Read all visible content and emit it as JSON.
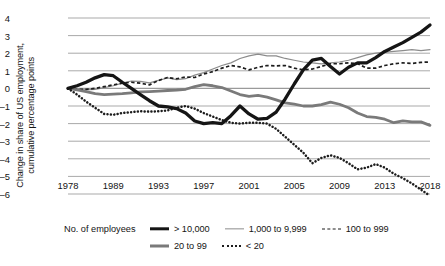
{
  "chart_data": {
    "type": "line",
    "title": "",
    "subtitle": "",
    "xlabel": "",
    "ylabel": "Change in share of US employment,\ncumulative percentage points",
    "ylabel_line1": "Change in share of US employment,",
    "ylabel_line2": "cumulative percentage points",
    "ylim": [
      -6,
      4
    ],
    "yticks": [
      4,
      3,
      2,
      1,
      0,
      -1,
      -2,
      -3,
      -4,
      -5,
      -6
    ],
    "ytick_labels": [
      "4",
      "3",
      "2",
      "1",
      "0",
      "–1",
      "–2",
      "–3",
      "–4",
      "–5",
      "–6"
    ],
    "xlim": [
      1978,
      2018
    ],
    "xticks": [
      1978,
      1989,
      1993,
      1997,
      2001,
      2005,
      2009,
      2013,
      2018
    ],
    "xtick_labels": [
      "1978",
      "1989",
      "1993",
      "1997",
      "2001",
      "2005",
      "2009",
      "2013",
      "2018"
    ],
    "grid": true,
    "grid_axis": "y",
    "legend_position": "bottom",
    "legend_title": "No. of employees",
    "colors": {
      "gt10000": "#151515",
      "k1000to9999": "#8c8c8c",
      "k100to999": "#1d1d1d",
      "k20to99": "#7a7a7a",
      "lt20": "#1d1d1d",
      "gridline": "#9a9a9a",
      "axis": "#4a4a4a",
      "text": "#141414",
      "background": "#ffffff"
    },
    "x": [
      1978,
      1979,
      1980,
      1981,
      1982,
      1983,
      1984,
      1985,
      1986,
      1987,
      1988,
      1989,
      1990,
      1991,
      1992,
      1993,
      1994,
      1995,
      1996,
      1997,
      1998,
      1999,
      2000,
      2001,
      2002,
      2003,
      2004,
      2005,
      2006,
      2007,
      2008,
      2009,
      2010,
      2011,
      2012,
      2013,
      2014,
      2015,
      2016,
      2017,
      2018
    ],
    "series": [
      {
        "name": "> 10,000",
        "style": "solid-thick",
        "color": "#151515",
        "values": [
          0.0,
          0.15,
          0.35,
          0.6,
          0.78,
          0.72,
          0.35,
          0.0,
          -0.35,
          -0.7,
          -1.0,
          -1.05,
          -1.15,
          -1.4,
          -1.85,
          -2.0,
          -1.95,
          -2.0,
          -1.55,
          -1.0,
          -1.45,
          -1.75,
          -1.7,
          -1.35,
          -0.6,
          0.25,
          1.05,
          1.6,
          1.7,
          1.25,
          0.82,
          1.2,
          1.45,
          1.45,
          1.75,
          2.1,
          2.35,
          2.6,
          2.9,
          3.2,
          3.6
        ]
      },
      {
        "name": "1,000 to 9,999",
        "style": "solid-thin",
        "color": "#8c8c8c",
        "values": [
          0.0,
          -0.05,
          -0.08,
          -0.05,
          0.05,
          0.15,
          0.3,
          0.42,
          0.4,
          0.32,
          0.45,
          0.6,
          0.5,
          0.55,
          0.75,
          0.9,
          1.1,
          1.3,
          1.45,
          1.7,
          1.85,
          1.95,
          1.85,
          1.85,
          1.7,
          1.6,
          1.5,
          1.45,
          1.4,
          1.45,
          1.5,
          1.6,
          1.75,
          1.9,
          2.0,
          2.05,
          2.1,
          2.15,
          2.2,
          2.15,
          2.2
        ]
      },
      {
        "name": "100 to 999",
        "style": "dashed",
        "color": "#1d1d1d",
        "values": [
          0.0,
          -0.05,
          -0.05,
          0.0,
          0.1,
          0.2,
          0.3,
          0.35,
          0.3,
          0.2,
          0.45,
          0.62,
          0.55,
          0.65,
          0.62,
          0.82,
          0.95,
          1.15,
          1.3,
          1.22,
          1.05,
          1.2,
          1.3,
          1.28,
          1.3,
          1.15,
          1.05,
          1.1,
          1.25,
          1.4,
          1.4,
          1.45,
          1.4,
          1.15,
          1.15,
          1.3,
          1.4,
          1.45,
          1.42,
          1.48,
          1.5
        ]
      },
      {
        "name": "20 to 99",
        "style": "solid-medium",
        "color": "#7a7a7a",
        "values": [
          0.0,
          -0.08,
          -0.18,
          -0.3,
          -0.35,
          -0.32,
          -0.3,
          -0.25,
          -0.2,
          -0.18,
          -0.15,
          -0.12,
          -0.1,
          -0.05,
          0.1,
          0.22,
          0.15,
          0.05,
          -0.15,
          -0.35,
          -0.45,
          -0.4,
          -0.5,
          -0.65,
          -0.82,
          -0.9,
          -1.0,
          -1.0,
          -0.92,
          -0.78,
          -0.9,
          -1.1,
          -1.4,
          -1.6,
          -1.65,
          -1.75,
          -1.95,
          -1.85,
          -1.9,
          -1.9,
          -2.1
        ]
      },
      {
        "name": "< 20",
        "style": "dotted",
        "color": "#1d1d1d",
        "values": [
          0.0,
          -0.35,
          -0.75,
          -1.1,
          -1.45,
          -1.5,
          -1.4,
          -1.35,
          -1.3,
          -1.32,
          -1.3,
          -1.25,
          -1.1,
          -1.0,
          -1.15,
          -1.4,
          -1.6,
          -1.8,
          -1.95,
          -2.0,
          -1.95,
          -1.95,
          -2.0,
          -2.3,
          -2.75,
          -3.2,
          -3.65,
          -4.25,
          -3.95,
          -3.8,
          -3.95,
          -4.25,
          -4.6,
          -4.5,
          -4.3,
          -4.5,
          -4.85,
          -5.1,
          -5.4,
          -5.75,
          -6.1
        ]
      }
    ]
  },
  "legend": {
    "title": "No. of employees",
    "items": [
      {
        "label": "> 10,000",
        "style": "solid-thick"
      },
      {
        "label": "1,000 to 9,999",
        "style": "solid-thin"
      },
      {
        "label": "100 to 999",
        "style": "dashed"
      },
      {
        "label": "20 to 99",
        "style": "solid-medium"
      },
      {
        "label": "< 20",
        "style": "dotted"
      }
    ]
  }
}
